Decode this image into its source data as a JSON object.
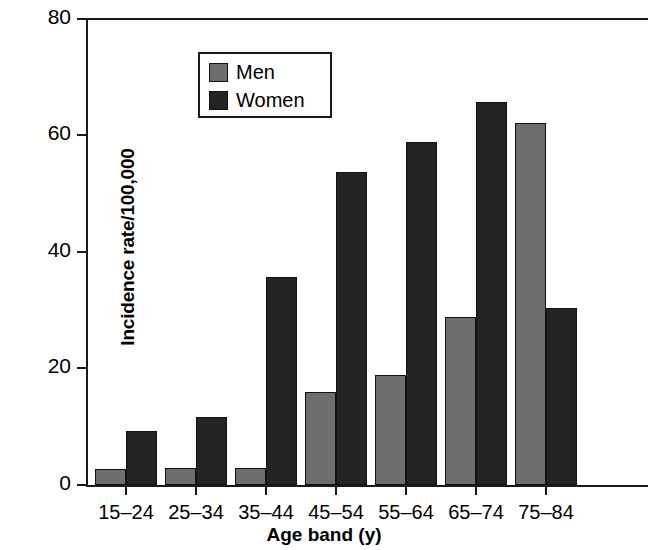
{
  "chart_data": {
    "type": "bar",
    "title": "",
    "xlabel": "Age band (y)",
    "ylabel": "Incidence rate/100,000",
    "categories": [
      "15–24",
      "25–34",
      "35–44",
      "45–54",
      "55–64",
      "65–74",
      "75–84"
    ],
    "series": [
      {
        "name": "Men",
        "color": "#6e6e6e",
        "values": [
          2.8,
          2.9,
          2.9,
          15.9,
          18.9,
          28.8,
          62.0
        ]
      },
      {
        "name": "Women",
        "color": "#242424",
        "values": [
          9.3,
          11.7,
          35.6,
          53.7,
          58.8,
          65.6,
          30.3
        ]
      }
    ],
    "ylim": [
      0,
      80
    ],
    "yticks": [
      "0",
      "20",
      "40",
      "60",
      "80"
    ],
    "ytick_values": [
      0,
      20,
      40,
      60,
      80
    ],
    "grid": false,
    "legend_position": "upper left",
    "legend_entries": [
      "Men",
      "Women"
    ]
  }
}
